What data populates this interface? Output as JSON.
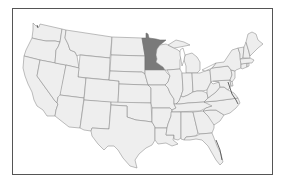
{
  "map": {
    "title": "",
    "region": "Contiguous United States",
    "highlighted_state": "Minnesota",
    "colors": {
      "default_fill": "#eeeeee",
      "highlight_fill": "#7a7a7a",
      "border": "#8a8a8a",
      "frame": "#555555",
      "background": "#ffffff"
    },
    "states": [
      "Washington",
      "Oregon",
      "California",
      "Nevada",
      "Idaho",
      "Montana",
      "Wyoming",
      "Utah",
      "Arizona",
      "Colorado",
      "New Mexico",
      "North Dakota",
      "South Dakota",
      "Nebraska",
      "Kansas",
      "Oklahoma",
      "Texas",
      "Minnesota",
      "Iowa",
      "Missouri",
      "Arkansas",
      "Louisiana",
      "Wisconsin",
      "Illinois",
      "Michigan",
      "Indiana",
      "Ohio",
      "Kentucky",
      "Tennessee",
      "Mississippi",
      "Alabama",
      "Georgia",
      "Florida",
      "South Carolina",
      "North Carolina",
      "Virginia",
      "West Virginia",
      "Maryland",
      "Delaware",
      "Pennsylvania",
      "New Jersey",
      "New York",
      "Connecticut",
      "Rhode Island",
      "Massachusetts",
      "Vermont",
      "New Hampshire",
      "Maine"
    ]
  }
}
